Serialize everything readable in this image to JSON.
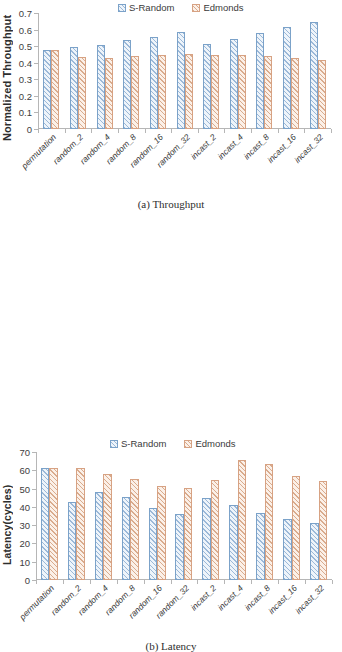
{
  "figures": [
    {
      "id": "throughput",
      "caption": "(a) Throughput",
      "ylabel": "Normalized Throughput",
      "legend": [
        "S-Random",
        "Edmonds"
      ]
    },
    {
      "id": "latency",
      "caption": "(b) Latency",
      "ylabel": "Latency(cycles)",
      "legend": [
        "S-Random",
        "Edmonds"
      ]
    }
  ],
  "colors": {
    "srandom_outline": "#7ba2c9",
    "srandom_fill": "#eef4fa",
    "edmonds_outline": "#d7a283",
    "edmonds_fill": "#fbf0e8",
    "axis": "#b6b6b6",
    "text": "#3a3a3a"
  },
  "chart_data": [
    {
      "type": "bar",
      "title": "(a) Throughput",
      "xlabel": "",
      "ylabel": "Normalized Throughput",
      "ylim": [
        0,
        0.7
      ],
      "yticks": [
        "0",
        "0.1",
        "0.2",
        "0.3",
        "0.4",
        "0.5",
        "0.6",
        "0.7"
      ],
      "ytick_values": [
        0,
        0.1,
        0.2,
        0.3,
        0.4,
        0.5,
        0.6,
        0.7
      ],
      "grid": false,
      "legend_position": "top-center",
      "categories": [
        "permutation",
        "random_2",
        "random_4",
        "random_8",
        "random_16",
        "random_32",
        "incast_2",
        "incast_4",
        "incast_8",
        "incast_16",
        "incast_32"
      ],
      "series": [
        {
          "name": "S-Random",
          "values": [
            0.477,
            0.495,
            0.51,
            0.536,
            0.557,
            0.586,
            0.516,
            0.545,
            0.578,
            0.616,
            0.648
          ]
        },
        {
          "name": "Edmonds",
          "values": [
            0.477,
            0.433,
            0.428,
            0.438,
            0.445,
            0.452,
            0.449,
            0.444,
            0.44,
            0.43,
            0.416
          ]
        }
      ]
    },
    {
      "type": "bar",
      "title": "(b) Latency",
      "xlabel": "",
      "ylabel": "Latency(cycles)",
      "ylim": [
        0,
        70
      ],
      "yticks": [
        "0",
        "10",
        "20",
        "30",
        "40",
        "50",
        "60",
        "70"
      ],
      "ytick_values": [
        0,
        10,
        20,
        30,
        40,
        50,
        60,
        70
      ],
      "grid": false,
      "legend_position": "top-center",
      "categories": [
        "permutation",
        "random_2",
        "random_4",
        "random_8",
        "random_16",
        "random_32",
        "incast_2",
        "incast_4",
        "incast_8",
        "incast_16",
        "incast_32"
      ],
      "series": [
        {
          "name": "S-Random",
          "values": [
            61.5,
            42.8,
            48.3,
            45.3,
            39.6,
            36.0,
            45.0,
            41.0,
            36.8,
            33.6,
            31.1
          ]
        },
        {
          "name": "Edmonds",
          "values": [
            61.2,
            61.0,
            58.0,
            55.2,
            51.3,
            50.5,
            54.8,
            65.4,
            63.7,
            57.0,
            54.1
          ]
        }
      ]
    }
  ]
}
